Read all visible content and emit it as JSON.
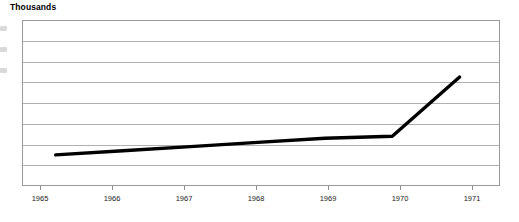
{
  "chart_data": {
    "type": "line",
    "title": "Thousands",
    "xlabel": "",
    "ylabel": "",
    "categories": [
      "1965",
      "1966",
      "1967",
      "1968",
      "1969",
      "1970",
      "1971"
    ],
    "x": [
      1965,
      1966,
      1967,
      1968,
      1969,
      1970,
      1971
    ],
    "series": [
      {
        "name": "Thousands",
        "color": "#000000",
        "values": [
          1.5,
          1.7,
          1.9,
          2.1,
          2.3,
          2.4,
          5.25
        ]
      }
    ],
    "ylim": [
      0,
      8
    ],
    "yticks": [
      0,
      1,
      2,
      3,
      4,
      5,
      6,
      7,
      8
    ],
    "xlim": [
      1964.5,
      1971.6
    ],
    "grid": true,
    "grid_axis": "y",
    "gridline_count": 7,
    "legend": "none",
    "annotations": []
  },
  "axis": {
    "x_labels": [
      "1965",
      "1966",
      "1967",
      "1968",
      "1969",
      "1970",
      "1971"
    ],
    "y_labels_clipped": true
  },
  "colors": {
    "line": "#000000",
    "grid": "#b0b0b0",
    "border": "#9a9a9a",
    "background": "#ffffff",
    "text": "#1a1a1a"
  }
}
